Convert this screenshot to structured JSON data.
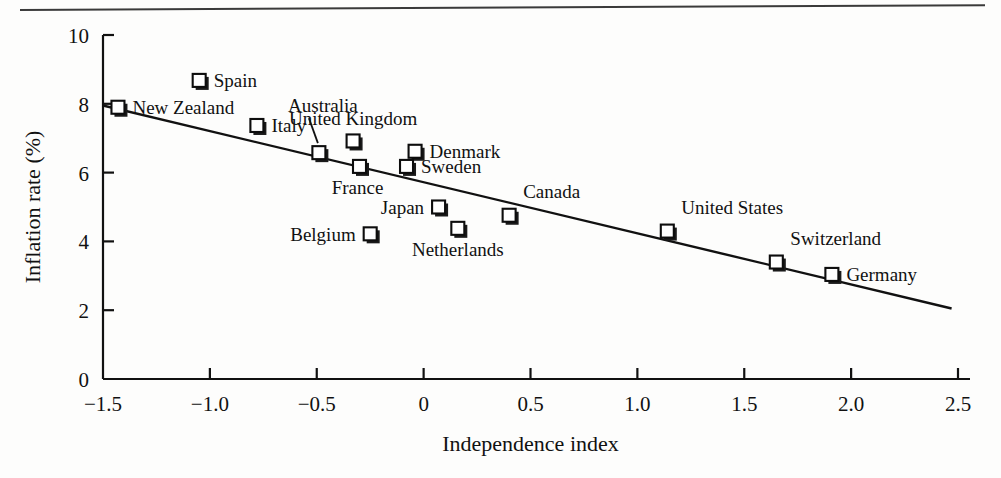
{
  "figure": {
    "background": "#fdfdfc",
    "ink_color": "#111111",
    "has_top_rule": true
  },
  "chart_data": {
    "type": "scatter",
    "title": "",
    "xlabel": "Independence index",
    "ylabel": "Inflation rate (%)",
    "xlim": [
      -1.5,
      2.5
    ],
    "ylim": [
      0,
      10
    ],
    "xticks": [
      -1.5,
      -1.0,
      -0.5,
      0,
      0.5,
      1.0,
      1.5,
      2.0,
      2.5
    ],
    "xticklabels": [
      "−1.5",
      "−1.0",
      "−0.5",
      "0",
      "0.5",
      "1.0",
      "1.5",
      "2.0",
      "2.5"
    ],
    "yticks": [
      0,
      2,
      4,
      6,
      8,
      10
    ],
    "yticklabels": [
      "0",
      "2",
      "4",
      "6",
      "8",
      "10"
    ],
    "grid": false,
    "legend": "none",
    "marker_style": "open-square",
    "points": [
      {
        "label": "New Zealand",
        "x": -1.43,
        "y": 7.9,
        "label_pos": "right",
        "leader": false
      },
      {
        "label": "Spain",
        "x": -1.05,
        "y": 8.68,
        "label_pos": "right",
        "leader": false
      },
      {
        "label": "Italy",
        "x": -0.78,
        "y": 7.37,
        "label_pos": "right",
        "leader": false
      },
      {
        "label": "Australia",
        "x": -0.49,
        "y": 6.58,
        "label_pos": "above-left",
        "leader": true
      },
      {
        "label": "United Kingdom",
        "x": -0.33,
        "y": 6.92,
        "label_pos": "above",
        "leader": false
      },
      {
        "label": "France",
        "x": -0.3,
        "y": 6.18,
        "label_pos": "below-left",
        "leader": false
      },
      {
        "label": "Denmark",
        "x": -0.04,
        "y": 6.62,
        "label_pos": "right",
        "leader": false
      },
      {
        "label": "Sweden",
        "x": -0.08,
        "y": 6.18,
        "label_pos": "right",
        "leader": false
      },
      {
        "label": "Japan",
        "x": 0.07,
        "y": 5.0,
        "label_pos": "left",
        "leader": false
      },
      {
        "label": "Belgium",
        "x": -0.25,
        "y": 4.22,
        "label_pos": "left",
        "leader": false
      },
      {
        "label": "Netherlands",
        "x": 0.16,
        "y": 4.38,
        "label_pos": "below",
        "leader": false
      },
      {
        "label": "Canada",
        "x": 0.4,
        "y": 4.76,
        "label_pos": "above-right",
        "leader": false
      },
      {
        "label": "United States",
        "x": 1.14,
        "y": 4.3,
        "label_pos": "above-right",
        "leader": false
      },
      {
        "label": "Switzerland",
        "x": 1.65,
        "y": 3.4,
        "label_pos": "above-right",
        "leader": false
      },
      {
        "label": "Germany",
        "x": 1.91,
        "y": 3.04,
        "label_pos": "right",
        "leader": false
      }
    ],
    "fit_line": {
      "type": "linear-regression",
      "x_start": -1.5,
      "y_start": 7.95,
      "x_end": 2.47,
      "y_end": 2.05
    }
  }
}
